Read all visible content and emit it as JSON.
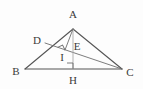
{
  "figure": {
    "name": "triangle-abc-with-cevians",
    "canvas": {
      "width": 143,
      "height": 89,
      "background": "#fdfdfd"
    },
    "style": {
      "stroke_dark": "#555555",
      "stroke_mid": "#6e6e6e",
      "stroke_light": "#a8a8a8",
      "label_color": "#3a3a3a",
      "label_font_size": 11,
      "stroke_width_main": 1.1,
      "stroke_width_thin": 0.9
    },
    "points": [
      {
        "id": "A",
        "label": "A",
        "x": 73,
        "y": 29,
        "label_x": 73,
        "label_y": 14
      },
      {
        "id": "B",
        "label": "B",
        "x": 25,
        "y": 69,
        "label_x": 16,
        "label_y": 71
      },
      {
        "id": "C",
        "label": "C",
        "x": 122,
        "y": 69,
        "label_x": 130,
        "label_y": 72
      },
      {
        "id": "D",
        "label": "D",
        "x": 45,
        "y": 43,
        "label_x": 37,
        "label_y": 40
      },
      {
        "id": "E",
        "label": "E",
        "x": 73,
        "y": 50,
        "label_x": 77,
        "label_y": 46
      },
      {
        "id": "I",
        "label": "I",
        "x": 65,
        "y": 50,
        "label_x": 62,
        "label_y": 57
      },
      {
        "id": "H",
        "label": "H",
        "x": 73,
        "y": 69,
        "label_x": 73,
        "label_y": 80
      }
    ],
    "segments": [
      {
        "id": "AB",
        "from": "A",
        "to": "B",
        "shade": "dark"
      },
      {
        "id": "AC",
        "from": "A",
        "to": "C",
        "shade": "dark"
      },
      {
        "id": "BC",
        "from": "B",
        "to": "C",
        "shade": "dark"
      },
      {
        "id": "DC",
        "from": "D",
        "to": "C",
        "shade": "mid"
      },
      {
        "id": "AH",
        "from": "A",
        "to": "H",
        "shade": "light"
      },
      {
        "id": "AI",
        "from": "A",
        "to": "I",
        "shade": "mid"
      }
    ],
    "right_angles": [
      {
        "id": "right-angle-at-I",
        "x": 65,
        "y": 50,
        "size": 5.5,
        "rotation": -26
      },
      {
        "id": "right-angle-at-H",
        "x": 73,
        "y": 69,
        "size": 6,
        "rotation": 0
      }
    ]
  }
}
